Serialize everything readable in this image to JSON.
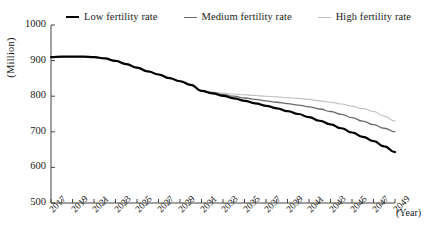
{
  "legend": {
    "position": "top",
    "items": [
      {
        "label": "Low fertility rate",
        "color": "#000000",
        "width": 2.2
      },
      {
        "label": "Medium fertility rate",
        "color": "#6b6b6b",
        "width": 1.3
      },
      {
        "label": "High fertility rate",
        "color": "#c0c0c0",
        "width": 1.1
      }
    ]
  },
  "axes": {
    "ylabel": "(Million)",
    "xlabel": "(Year)",
    "ytick_labels": [
      "1000",
      "900",
      "800",
      "700",
      "600",
      "500"
    ],
    "xtick_labels": [
      "2017",
      "2019",
      "2021",
      "2023",
      "2025",
      "2027",
      "2029",
      "2031",
      "2033",
      "2035",
      "2037",
      "2039",
      "2041",
      "2043",
      "2045",
      "2047",
      "2049"
    ]
  },
  "chart_data": {
    "type": "line",
    "title": "",
    "xlabel": "(Year)",
    "ylabel": "(Million)",
    "xlim": [
      2017,
      2049
    ],
    "ylim": [
      500,
      1000
    ],
    "ytick_step": 100,
    "xtick_step": 1,
    "xtick_label_step": 2,
    "grid": false,
    "legend_position": "top",
    "x": [
      2017,
      2018,
      2019,
      2020,
      2021,
      2022,
      2023,
      2024,
      2025,
      2026,
      2027,
      2028,
      2029,
      2030,
      2031,
      2032,
      2033,
      2034,
      2035,
      2036,
      2037,
      2038,
      2039,
      2040,
      2041,
      2042,
      2043,
      2044,
      2045,
      2046,
      2047,
      2048,
      2049
    ],
    "series": [
      {
        "name": "Low fertility rate",
        "color": "#000000",
        "values": [
          910,
          911,
          911,
          911,
          910,
          906,
          899,
          890,
          880,
          870,
          861,
          851,
          842,
          832,
          815,
          808,
          801,
          794,
          787,
          780,
          773,
          766,
          758,
          750,
          741,
          731,
          721,
          710,
          698,
          686,
          674,
          659,
          643
        ]
      },
      {
        "name": "Medium fertility rate",
        "color": "#6b6b6b",
        "values": [
          910,
          911,
          911,
          911,
          910,
          906,
          899,
          890,
          880,
          870,
          861,
          851,
          842,
          832,
          815,
          810,
          805,
          800,
          795,
          791,
          787,
          783,
          779,
          775,
          770,
          764,
          757,
          749,
          740,
          730,
          720,
          710,
          700
        ]
      },
      {
        "name": "High fertility rate",
        "color": "#c0c0c0",
        "values": [
          910,
          911,
          911,
          911,
          910,
          906,
          899,
          890,
          880,
          870,
          861,
          851,
          842,
          832,
          815,
          812,
          809,
          806,
          804,
          802,
          800,
          798,
          796,
          794,
          791,
          787,
          783,
          778,
          772,
          765,
          757,
          744,
          730
        ]
      }
    ]
  }
}
